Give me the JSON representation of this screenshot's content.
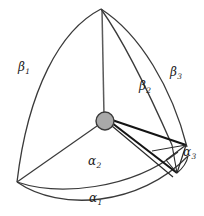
{
  "figure": {
    "background_color": "#ffffff",
    "stroke_color": "#333333",
    "thick_stroke_color": "#1a1a1a",
    "node": {
      "fill_color": "#a9a9a9",
      "stroke_color": "#3a3a3a",
      "cx": 105,
      "cy": 121,
      "r": 9
    },
    "vertices": {
      "apex": {
        "x": 101,
        "y": 9
      },
      "bottom_left": {
        "x": 17,
        "y": 182
      },
      "right": {
        "x": 186,
        "y": 145
      },
      "right_lower": {
        "x": 178,
        "y": 172
      }
    }
  },
  "labels": {
    "beta_1": {
      "base": "β",
      "sub": "1",
      "x": 18,
      "y": 68
    },
    "beta_2": {
      "base": "β",
      "sub": "2",
      "x": 139,
      "y": 84
    },
    "beta_3": {
      "base": "β",
      "sub": "3",
      "x": 170,
      "y": 70
    },
    "alpha_1": {
      "base": "α",
      "sub": "1",
      "x": 88,
      "y": 196
    },
    "alpha_2": {
      "base": "α",
      "sub": "2",
      "x": 88,
      "y": 159
    },
    "alpha_3": {
      "base": "α",
      "sub": "3",
      "x": 183,
      "y": 150
    }
  },
  "edges": {
    "arc_beta_1_label": "outer-left-arc",
    "arc_beta_3_label": "outer-right-arc",
    "line_beta_2_label": "inner-right-edge",
    "arc_alpha_1_label": "outer-bottom-arc",
    "arc_alpha_2_label": "inner-bottom-arc",
    "edge_center_apex_label": "center-to-apex",
    "edge_center_bottom_left_label": "center-to-bottom-left",
    "wedge_label": "center-to-right-wedge"
  }
}
